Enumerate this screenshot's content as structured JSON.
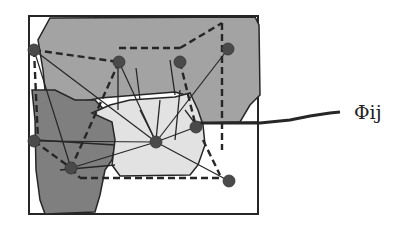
{
  "diagram": {
    "label": "Φij",
    "colors": {
      "region_mid": "#a3a3a3",
      "region_dark": "#7f7f7f",
      "region_light": "#e2e2e2",
      "node": "#4a4a4a",
      "stroke": "#262626"
    },
    "nodes": [
      {
        "id": "n1",
        "x": 34,
        "y": 50
      },
      {
        "id": "n2",
        "x": 119,
        "y": 62
      },
      {
        "id": "n3",
        "x": 180,
        "y": 62
      },
      {
        "id": "n4",
        "x": 228,
        "y": 49
      },
      {
        "id": "n5",
        "x": 34,
        "y": 141
      },
      {
        "id": "n6",
        "x": 156,
        "y": 142
      },
      {
        "id": "n7",
        "x": 196,
        "y": 127
      },
      {
        "id": "n8",
        "x": 71,
        "y": 168
      },
      {
        "id": "n9",
        "x": 229,
        "y": 181
      }
    ]
  }
}
